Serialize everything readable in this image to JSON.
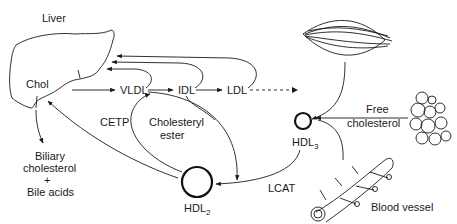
{
  "diagram": {
    "organs": {
      "liver": "Liver",
      "chol": "Chol",
      "blood_vessel": "Blood vessel"
    },
    "lipoproteins": {
      "vldl": "VLDL",
      "idl": "IDL",
      "ldl": "LDL",
      "hdl3": "HDL",
      "hdl3_sub": "3",
      "hdl2": "HDL",
      "hdl2_sub": "2"
    },
    "enzymes": {
      "cetp": "CETP",
      "lcat": "LCAT"
    },
    "labels": {
      "cholesteryl": "Cholesteryl",
      "ester": "ester",
      "free": "Free",
      "cholesterol": "cholesterol",
      "biliary": "Biliary",
      "biliary_cholesterol": "cholesterol",
      "plus": "+",
      "bile_acids": "Bile acids"
    },
    "colors": {
      "stroke": "#1a1a1a",
      "background": "#ffffff"
    }
  }
}
